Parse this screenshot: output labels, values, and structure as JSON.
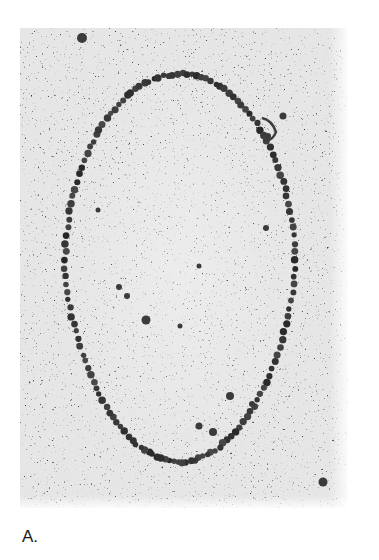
{
  "figure": {
    "panel_label": "A.",
    "colors": {
      "background": "#ffffff",
      "grain_base": "#e4e4e4",
      "bead": "#3a3a3a",
      "label": "#1a1a1a"
    },
    "loop": {
      "shape": "ellipse",
      "center_x": 180,
      "center_y": 268,
      "radius_x": 115,
      "radius_y": 194
    },
    "blobs": [
      {
        "x": 82,
        "y": 38,
        "r": 5
      },
      {
        "x": 283,
        "y": 116,
        "r": 3.5
      },
      {
        "x": 268,
        "y": 136,
        "r": 3
      },
      {
        "x": 119,
        "y": 287,
        "r": 3
      },
      {
        "x": 127,
        "y": 296,
        "r": 3
      },
      {
        "x": 146,
        "y": 320,
        "r": 4.5
      },
      {
        "x": 230,
        "y": 396,
        "r": 4
      },
      {
        "x": 252,
        "y": 404,
        "r": 3
      },
      {
        "x": 199,
        "y": 426,
        "r": 3.5
      },
      {
        "x": 213,
        "y": 432,
        "r": 4
      },
      {
        "x": 323,
        "y": 482,
        "r": 4.5
      },
      {
        "x": 98,
        "y": 210,
        "r": 2.5
      },
      {
        "x": 266,
        "y": 228,
        "r": 3
      },
      {
        "x": 199,
        "y": 266,
        "r": 2.5
      },
      {
        "x": 180,
        "y": 326,
        "r": 2.5
      }
    ]
  }
}
